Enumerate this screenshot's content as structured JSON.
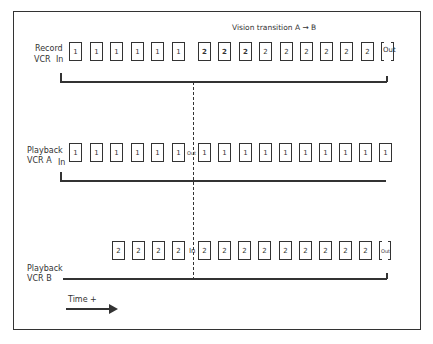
{
  "title": "Vision transition A → B",
  "rows": {
    "record": {
      "label_line1": "Record",
      "label_line2": "VCR",
      "in_label": "In",
      "frames": [
        "1",
        "1",
        "1",
        "1",
        "1",
        "1",
        "2",
        "2",
        "2",
        "2",
        "2",
        "2",
        "2",
        "2",
        "2"
      ],
      "transition_frames": [
        6,
        7,
        8
      ],
      "out_label": "Out"
    },
    "playback_a": {
      "label_line1": "Playback",
      "label_line2": "VCR A",
      "in_label": "In",
      "frames_before": [
        "1",
        "1",
        "1",
        "1",
        "1",
        "1"
      ],
      "out_label": "Out",
      "frames_after": [
        "1",
        "1",
        "1",
        "1",
        "1",
        "1",
        "1",
        "1",
        "1",
        "1"
      ]
    },
    "playback_b": {
      "label_line1": "Playback",
      "label_line2": "VCR B",
      "frames_before": [
        "2",
        "2",
        "2",
        "2"
      ],
      "in_label": "In",
      "frames_after": [
        "2",
        "2",
        "2",
        "2",
        "2",
        "2",
        "2",
        "2",
        "2"
      ],
      "out_label": "Out"
    }
  },
  "time_axis": {
    "label": "Time +",
    "icon": "right-arrow-icon"
  },
  "colors": {
    "ink": "#333333",
    "background": "#ffffff"
  }
}
